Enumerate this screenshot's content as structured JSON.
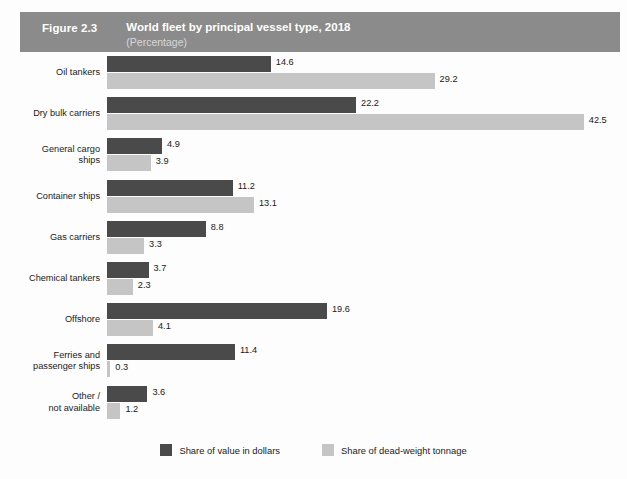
{
  "header": {
    "figure_number": "Figure 2.3",
    "title": "World fleet by principal vessel type, 2018",
    "subtitle": "(Percentage)",
    "band_color": "#8b8b8b"
  },
  "legend": {
    "items": [
      {
        "label": "Share of value in dollars",
        "color": "#4a4a4a",
        "key": "value_in_dollars"
      },
      {
        "label": "Share of dead-weight tonnage",
        "color": "#c5c5c5",
        "key": "dead_weight_tonnage"
      }
    ]
  },
  "chart_data": {
    "type": "bar",
    "orientation": "horizontal",
    "title": "World fleet by principal vessel type, 2018",
    "subtitle": "(Percentage)",
    "xlabel": "",
    "ylabel": "",
    "xlim": [
      0,
      45
    ],
    "grid": false,
    "legend_position": "bottom-center",
    "categories": [
      "Oil tankers",
      "Dry bulk carriers",
      "General cargo ships",
      "Container ships",
      "Gas carriers",
      "Chemical tankers",
      "Offshore",
      "Ferries and passenger ships",
      "Other / not available"
    ],
    "category_label_lines": [
      [
        "Oil tankers"
      ],
      [
        "Dry bulk carriers"
      ],
      [
        "General cargo",
        "ships"
      ],
      [
        "Container ships"
      ],
      [
        "Gas carriers"
      ],
      [
        "Chemical tankers"
      ],
      [
        "Offshore"
      ],
      [
        "Ferries and",
        "passenger ships"
      ],
      [
        "Other /",
        "not available"
      ]
    ],
    "series": [
      {
        "name": "Share of value in dollars",
        "color": "#4a4a4a",
        "values": [
          14.6,
          22.2,
          4.9,
          11.2,
          8.8,
          3.7,
          19.6,
          11.4,
          3.6
        ],
        "value_labels": [
          "14.6",
          "22.2",
          "4.9",
          "11.2",
          "8.8",
          "3.7",
          "19.6",
          "11.4",
          "3.6"
        ]
      },
      {
        "name": "Share of dead-weight tonnage",
        "color": "#c5c5c5",
        "values": [
          29.2,
          42.5,
          3.9,
          13.1,
          3.3,
          2.3,
          4.1,
          0.3,
          1.2
        ],
        "value_labels": [
          "29.2",
          "42.5",
          "3.9",
          "13.1",
          "3.3",
          "2.3",
          "4.1",
          "0.3",
          "1.2"
        ]
      }
    ]
  }
}
